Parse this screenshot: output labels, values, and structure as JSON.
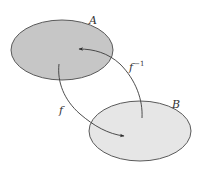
{
  "diagram": {
    "sets": [
      {
        "id": "A",
        "label": "A",
        "fill": "#c6c6c6",
        "stroke": "#5a5a5a",
        "cx": 62,
        "cy": 50,
        "rx": 51,
        "ry": 30,
        "label_x": 89,
        "label_y": 24
      },
      {
        "id": "B",
        "label": "B",
        "fill": "#e6e6e6",
        "stroke": "#5a5a5a",
        "cx": 140,
        "cy": 131,
        "rx": 51,
        "ry": 30,
        "label_x": 172,
        "label_y": 108
      }
    ],
    "arrows": [
      {
        "id": "f",
        "label": "f",
        "from": "A",
        "to": "B",
        "label_x": 59,
        "label_y": 114
      },
      {
        "id": "f_inverse",
        "label": "f",
        "superscript": "−1",
        "from": "B",
        "to": "A",
        "label_x": 129,
        "label_y": 71
      }
    ],
    "colors": {
      "arrow": "#3a3a3a",
      "text": "#333333"
    }
  }
}
